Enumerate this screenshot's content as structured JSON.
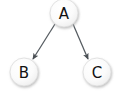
{
  "diagram": {
    "background_color": "#ffffff",
    "width": 120,
    "height": 93,
    "node_style": {
      "fill_center": "#ffffff",
      "fill_edge": "#f0f0f0",
      "stroke": "#d8d8d8",
      "shadow": "#c9c9c9",
      "label_color": "#111111",
      "radius": 14
    },
    "edge_style": {
      "stroke": "#555b60",
      "stroke_width": 1.25,
      "arrowhead": "solid-triangle",
      "arrowhead_color": "#4a4f54"
    },
    "nodes": [
      {
        "id": "A",
        "label": "A",
        "cx": 64,
        "cy": 13,
        "r": 14
      },
      {
        "id": "B",
        "label": "B",
        "cx": 24,
        "cy": 72,
        "r": 14
      },
      {
        "id": "C",
        "label": "C",
        "cx": 97,
        "cy": 72,
        "r": 14
      }
    ],
    "edges": [
      {
        "id": "A-B",
        "from": "A",
        "to": "B",
        "label": "",
        "directed": true,
        "x1": 55,
        "y1": 24,
        "x2": 33,
        "y2": 59
      },
      {
        "id": "A-C",
        "from": "A",
        "to": "C",
        "label": "",
        "directed": true,
        "x1": 73,
        "y1": 24,
        "x2": 88,
        "y2": 59
      }
    ]
  }
}
